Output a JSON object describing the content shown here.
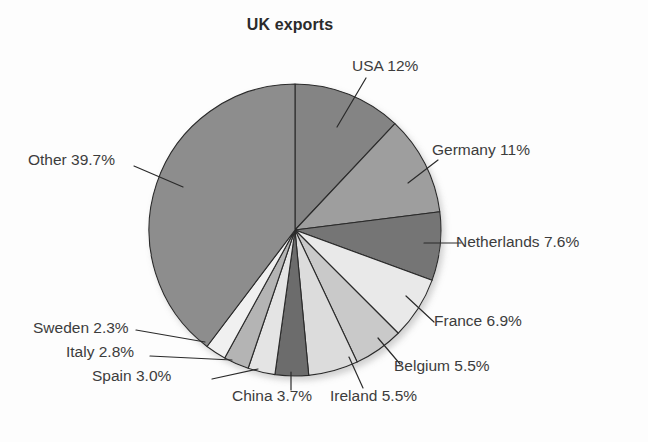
{
  "chart_data": {
    "type": "pie",
    "title": "UK exports",
    "xlabel": "",
    "ylabel": "",
    "legend_position": "callout-labels",
    "grid": false,
    "units": "percent",
    "categories": [
      "USA",
      "Germany",
      "Netherlands",
      "France",
      "Belgium",
      "Ireland",
      "China",
      "Spain",
      "Italy",
      "Sweden",
      "Other"
    ],
    "values": [
      12,
      11,
      7.6,
      6.9,
      5.5,
      5.5,
      3.7,
      3.0,
      2.8,
      2.3,
      39.7
    ],
    "slices": [
      {
        "label": "USA 12%",
        "name": "USA",
        "value": 12,
        "value_text": "12%",
        "color": "#848484"
      },
      {
        "label": "Germany 11%",
        "name": "Germany",
        "value": 11,
        "value_text": "11%",
        "color": "#9e9e9e"
      },
      {
        "label": "Netherlands 7.6%",
        "name": "Netherlands",
        "value": 7.6,
        "value_text": "7.6%",
        "color": "#757575"
      },
      {
        "label": "France 6.9%",
        "name": "France",
        "value": 6.9,
        "value_text": "6.9%",
        "color": "#e9e9e9"
      },
      {
        "label": "Belgium 5.5%",
        "name": "Belgium",
        "value": 5.5,
        "value_text": "5.5%",
        "color": "#c9c9c9"
      },
      {
        "label": "Ireland 5.5%",
        "name": "Ireland",
        "value": 5.5,
        "value_text": "5.5%",
        "color": "#dcdcdc"
      },
      {
        "label": "China 3.7%",
        "name": "China",
        "value": 3.7,
        "value_text": "3.7%",
        "color": "#6c6c6c"
      },
      {
        "label": "Spain 3.0%",
        "name": "Spain",
        "value": 3.0,
        "value_text": "3.0%",
        "color": "#e4e4e4"
      },
      {
        "label": "Italy 2.8%",
        "name": "Italy",
        "value": 2.8,
        "value_text": "2.8%",
        "color": "#b4b4b4"
      },
      {
        "label": "Sweden 2.3%",
        "name": "Sweden",
        "value": 2.3,
        "value_text": "2.3%",
        "color": "#f0f0f0"
      },
      {
        "label": "Other 39.7%",
        "name": "Other",
        "value": 39.7,
        "value_text": "39.7%",
        "color": "#8d8d8d"
      }
    ],
    "total": 100
  },
  "geometry": {
    "center_x": 295,
    "center_y": 230,
    "radius": 146,
    "start_angle_deg": 0,
    "direction": "clockwise"
  },
  "leaders": [
    {
      "name": "USA",
      "x1": 337,
      "y1": 127,
      "x2": 366,
      "y2": 78
    },
    {
      "name": "Germany",
      "x1": 408,
      "y1": 183,
      "x2": 438,
      "y2": 160
    },
    {
      "name": "Netherlands",
      "x1": 424,
      "y1": 243,
      "x2": 461,
      "y2": 243
    },
    {
      "name": "France",
      "x1": 406,
      "y1": 296,
      "x2": 434,
      "y2": 322
    },
    {
      "name": "Belgium",
      "x1": 378,
      "y1": 338,
      "x2": 400,
      "y2": 364
    },
    {
      "name": "Ireland",
      "x1": 349,
      "y1": 357,
      "x2": 363,
      "y2": 388
    },
    {
      "name": "China",
      "x1": 291,
      "y1": 372,
      "x2": 291,
      "y2": 390
    },
    {
      "name": "Spain",
      "x1": 258,
      "y1": 369,
      "x2": 212,
      "y2": 379
    },
    {
      "name": "Italy",
      "x1": 232,
      "y1": 360,
      "x2": 150,
      "y2": 356
    },
    {
      "name": "Sweden",
      "x1": 205,
      "y1": 342,
      "x2": 136,
      "y2": 330
    },
    {
      "name": "Other",
      "x1": 183,
      "y1": 187,
      "x2": 134,
      "y2": 166
    }
  ]
}
